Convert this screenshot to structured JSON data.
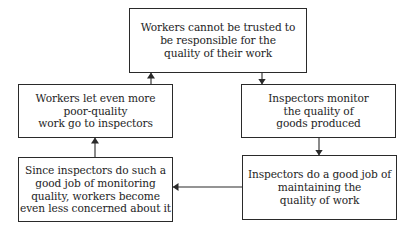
{
  "diagram": {
    "type": "cycle-flowchart",
    "nodes": [
      {
        "id": "top",
        "lines": [
          "Workers cannot be trusted to",
          "be responsible for the",
          "quality of their work"
        ]
      },
      {
        "id": "right_middle",
        "lines": [
          "Inspectors monitor",
          "the quality of",
          "goods produced"
        ]
      },
      {
        "id": "right_bottom",
        "lines": [
          "Inspectors do a good job of",
          "maintaining the",
          "quality of work"
        ]
      },
      {
        "id": "left_bottom",
        "lines": [
          "Since inspectors do such a",
          "good job of monitoring",
          "quality, workers become",
          "even less concerned about it"
        ]
      },
      {
        "id": "left_middle",
        "lines": [
          "Workers let even more",
          "poor-quality",
          "work go to inspectors"
        ]
      }
    ],
    "edges": [
      {
        "from": "top",
        "to": "right_middle"
      },
      {
        "from": "right_middle",
        "to": "right_bottom"
      },
      {
        "from": "right_bottom",
        "to": "left_bottom"
      },
      {
        "from": "left_bottom",
        "to": "left_middle"
      },
      {
        "from": "left_middle",
        "to": "top"
      }
    ],
    "colors": {
      "line": "#2a2a2a",
      "text": "#1e1e1e",
      "background": "#ffffff"
    }
  }
}
